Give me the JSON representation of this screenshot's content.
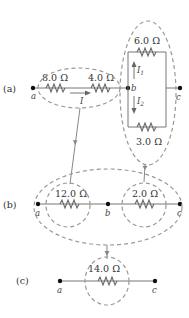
{
  "diagram": {
    "panels": [
      {
        "label": "(a)",
        "nodes": [
          "a",
          "b",
          "c"
        ],
        "resistors": [
          {
            "value": "8.0 Ω",
            "position": "series left"
          },
          {
            "value": "4.0 Ω",
            "position": "series left"
          },
          {
            "value": "6.0 Ω",
            "position": "parallel top"
          },
          {
            "value": "3.0 Ω",
            "position": "parallel bottom"
          }
        ],
        "currents": [
          "I",
          "I1",
          "I2"
        ]
      },
      {
        "label": "(b)",
        "nodes": [
          "a",
          "b",
          "c"
        ],
        "resistors": [
          {
            "value": "12.0 Ω"
          },
          {
            "value": "2.0 Ω"
          }
        ]
      },
      {
        "label": "(c)",
        "nodes": [
          "a",
          "c"
        ],
        "resistors": [
          {
            "value": "14.0 Ω"
          }
        ]
      }
    ]
  },
  "labels": {
    "panel_a": "(a)",
    "panel_b": "(b)",
    "panel_c": "(c)",
    "r8": "8.0 Ω",
    "r4": "4.0 Ω",
    "r6": "6.0 Ω",
    "r3": "3.0 Ω",
    "r12": "12.0 Ω",
    "r2": "2.0 Ω",
    "r14": "14.0 Ω",
    "node_a": "a",
    "node_b": "b",
    "node_c": "c",
    "current_I": "I",
    "current_I1": "I",
    "current_I1_sub": "1",
    "current_I2": "I",
    "current_I2_sub": "2"
  }
}
